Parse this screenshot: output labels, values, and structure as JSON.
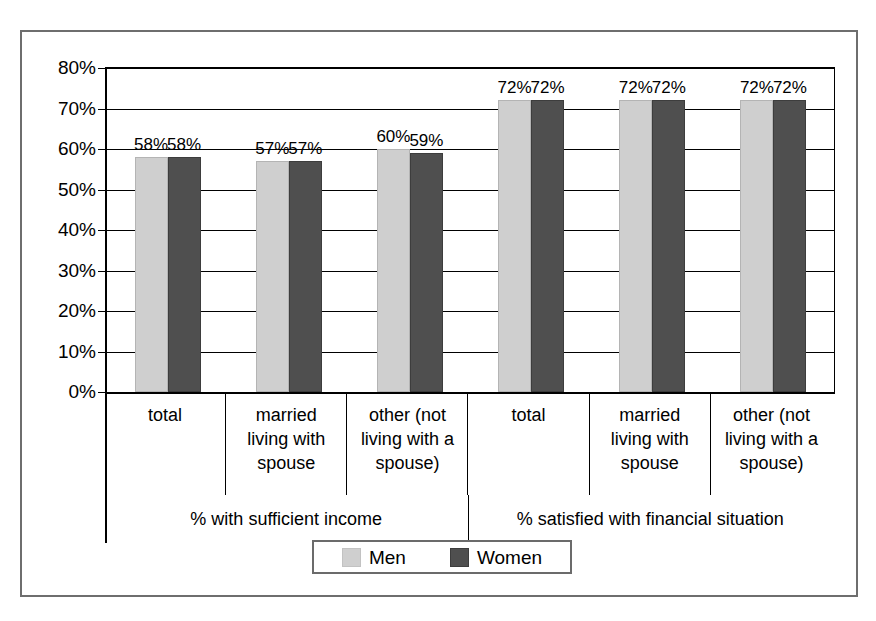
{
  "chart_data": {
    "type": "bar",
    "title": "",
    "subtitle": "",
    "xlabel": "",
    "ylabel": "",
    "ylim": [
      0,
      80
    ],
    "ytick_labels": [
      "80%",
      "70%",
      "60%",
      "50%",
      "40%",
      "30%",
      "20%",
      "10%",
      "0%"
    ],
    "ytick_values": [
      80,
      70,
      60,
      50,
      40,
      30,
      20,
      10,
      0
    ],
    "grid": true,
    "legend_position": "bottom",
    "categories": [
      "total",
      "married living with spouse",
      "other (not living with a spouse)",
      "total",
      "married living with spouse",
      "other (not living with a spouse)"
    ],
    "category_lines": [
      [
        "total"
      ],
      [
        "married",
        "living with",
        "spouse"
      ],
      [
        "other (not",
        "living with a",
        "spouse)"
      ],
      [
        "total"
      ],
      [
        "married",
        "living with",
        "spouse"
      ],
      [
        "other (not",
        "living with a",
        "spouse)"
      ]
    ],
    "groups": [
      {
        "label": "% with sufficient income",
        "span": 3
      },
      {
        "label": "% satisfied with financial situation",
        "span": 3
      }
    ],
    "series": [
      {
        "name": "Men",
        "color": "#cfcfcf",
        "values": [
          58,
          57,
          60,
          72,
          72,
          72
        ],
        "labels": [
          "58%",
          "57%",
          "60%",
          "72%",
          "72%",
          "72%"
        ]
      },
      {
        "name": "Women",
        "color": "#4f4f4f",
        "values": [
          58,
          57,
          59,
          72,
          72,
          72
        ],
        "labels": [
          "58%",
          "57%",
          "59%",
          "72%",
          "72%",
          "72%"
        ]
      }
    ]
  },
  "legend": {
    "items": [
      {
        "label": "Men",
        "color": "#cfcfcf"
      },
      {
        "label": "Women",
        "color": "#4f4f4f"
      }
    ]
  },
  "colors": {
    "men": "#cfcfcf",
    "women": "#4f4f4f",
    "axis": "#000000",
    "frame": "#6e6e6e",
    "background": "#ffffff"
  }
}
